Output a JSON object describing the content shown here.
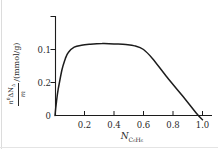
{
  "figure": {
    "background": "#ffffff",
    "line_color": "#1c1c1c",
    "text_color": "#2a2a2a"
  },
  "yaxis": {
    "num_base": "n",
    "num_sup": "0",
    "num_mid": "ΔN",
    "num_sub": "Δ",
    "den": "m",
    "units": "/(mmol/g)"
  },
  "xaxis": {
    "base": "N",
    "sub": "C₆H₆"
  },
  "chart_data": {
    "type": "line",
    "title": "",
    "xlabel": "N_C6H6",
    "ylabel": "n0ΔN_Δ/m /(mmol/g)",
    "xlim": [
      0,
      1.06
    ],
    "ylim": [
      -0.015,
      0.15
    ],
    "grid": false,
    "legend": null,
    "xticks": [
      {
        "label": "0.2",
        "value": 0.2
      },
      {
        "label": "0.4",
        "value": 0.4
      },
      {
        "label": "0.6",
        "value": 0.6
      },
      {
        "label": "0.8",
        "value": 0.8
      },
      {
        "label": "1.0",
        "value": 1.0
      }
    ],
    "yticks_bottom_to_top_as_printed": [
      "0",
      "0.2",
      "0.1"
    ],
    "yticks": [
      {
        "label": "0",
        "value": 0
      },
      {
        "label": "0.2",
        "value": 0.05
      },
      {
        "label": "0.1",
        "value": 0.1
      },
      {
        "label": "",
        "value": 0.15
      }
    ],
    "series": [
      {
        "name": "adsorption-excess-isotherm",
        "points": [
          [
            0,
            0
          ],
          [
            0.01,
            0.021
          ],
          [
            0.022,
            0.04
          ],
          [
            0.047,
            0.069
          ],
          [
            0.07,
            0.086
          ],
          [
            0.09,
            0.0955
          ],
          [
            0.13,
            0.1035
          ],
          [
            0.18,
            0.1065
          ],
          [
            0.24,
            0.108
          ],
          [
            0.32,
            0.109
          ],
          [
            0.4,
            0.1085
          ],
          [
            0.48,
            0.1075
          ],
          [
            0.54,
            0.1055
          ],
          [
            0.6,
            0.1
          ],
          [
            0.66,
            0.0865
          ],
          [
            0.76,
            0.058
          ],
          [
            0.86,
            0.031
          ],
          [
            0.96,
            0.003
          ],
          [
            1.0,
            -0.0065
          ]
        ]
      }
    ]
  }
}
